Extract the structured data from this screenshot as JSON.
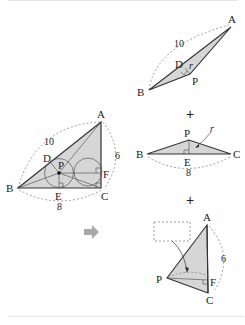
{
  "main_figure": {
    "vertices": {
      "A": "A",
      "B": "B",
      "C": "C",
      "D": "D",
      "E": "E",
      "F": "F",
      "P": "P"
    },
    "lengths": {
      "AB": "10",
      "AC": "6",
      "BC": "8"
    }
  },
  "arrow": {
    "icon": "right-arrow-icon",
    "color": "#a8a8a8"
  },
  "parts": [
    {
      "name": "triangle-ABP",
      "labels": {
        "A": "A",
        "B": "B",
        "D": "D",
        "P": "P",
        "r": "r"
      },
      "length": "10"
    },
    {
      "operator": "+"
    },
    {
      "name": "triangle-BCP",
      "labels": {
        "B": "B",
        "C": "C",
        "E": "E",
        "P": "P",
        "r": "r"
      },
      "length": "8"
    },
    {
      "operator": "+"
    },
    {
      "name": "triangle-CAP",
      "labels": {
        "A": "A",
        "C": "C",
        "F": "F",
        "P": "P"
      },
      "length": "6",
      "blank_box": ""
    }
  ],
  "colors": {
    "fill": "#d6d6d6",
    "stroke": "#333333",
    "dashed": "#777777"
  }
}
